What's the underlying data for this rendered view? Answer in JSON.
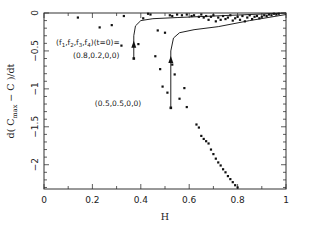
{
  "chart_data": {
    "type": "scatter",
    "title": "",
    "xlabel": "H",
    "ylabel": "d( C_max − C )/dt",
    "ylabel_parts": {
      "prefix": "d( C",
      "subscript": "max",
      "suffix": " − C )/dt"
    },
    "xlim": [
      0,
      1
    ],
    "ylim": [
      -2.32,
      0
    ],
    "grid": false,
    "legend": null,
    "x_ticks": [
      {
        "value": 0,
        "label": "0"
      },
      {
        "value": 0.2,
        "label": "0.2"
      },
      {
        "value": 0.4,
        "label": "0.4"
      },
      {
        "value": 0.6,
        "label": "0.6"
      },
      {
        "value": 0.8,
        "label": "0.8"
      },
      {
        "value": 1,
        "label": "1"
      }
    ],
    "y_ticks": [
      {
        "value": 0,
        "label": "0"
      },
      {
        "value": -0.5,
        "label": "−0.5"
      },
      {
        "value": -1,
        "label": "−1"
      },
      {
        "value": -1.5,
        "label": "−1.5"
      },
      {
        "value": -2,
        "label": "−2"
      }
    ],
    "annotations": [
      {
        "text": "(f1,f2,f3,f4)(t=0)=",
        "text_parts": [
          "(f",
          "1",
          ",f",
          "2",
          ",f",
          "3",
          ",f",
          "4",
          ")(t=0)="
        ],
        "x": 0.05,
        "y": -0.42
      },
      {
        "text": "(0.8,0.2,0,0)",
        "x": 0.12,
        "y": -0.59
      },
      {
        "text": "(0.5,0.5,0,0)",
        "x": 0.21,
        "y": -1.22
      }
    ],
    "series": [
      {
        "name": "scatter points",
        "kind": "points",
        "points": [
          [
            0.14,
            -0.06
          ],
          [
            0.23,
            -0.19
          ],
          [
            0.28,
            -0.16
          ],
          [
            0.33,
            -0.04
          ],
          [
            0.32,
            -0.43
          ],
          [
            0.39,
            -0.41
          ],
          [
            0.41,
            -0.07
          ],
          [
            0.43,
            -0.01
          ],
          [
            0.44,
            -0.02
          ],
          [
            0.52,
            -0.03
          ],
          [
            0.53,
            -0.04
          ],
          [
            0.55,
            -0.02
          ],
          [
            0.57,
            -0.03
          ],
          [
            0.59,
            -0.02
          ],
          [
            0.61,
            -0.04
          ],
          [
            0.62,
            -0.03
          ],
          [
            0.64,
            -0.05
          ],
          [
            0.65,
            -0.02
          ],
          [
            0.66,
            -0.06
          ],
          [
            0.67,
            -0.04
          ],
          [
            0.68,
            -0.09
          ],
          [
            0.69,
            -0.05
          ],
          [
            0.7,
            -0.03
          ],
          [
            0.71,
            -0.11
          ],
          [
            0.72,
            -0.06
          ],
          [
            0.73,
            -0.09
          ],
          [
            0.74,
            -0.04
          ],
          [
            0.75,
            -0.08
          ],
          [
            0.76,
            -0.06
          ],
          [
            0.77,
            -0.03
          ],
          [
            0.78,
            -0.1
          ],
          [
            0.79,
            -0.07
          ],
          [
            0.8,
            -0.05
          ],
          [
            0.81,
            -0.09
          ],
          [
            0.82,
            -0.04
          ],
          [
            0.83,
            -0.11
          ],
          [
            0.84,
            -0.06
          ],
          [
            0.85,
            -0.03
          ],
          [
            0.86,
            -0.08
          ],
          [
            0.87,
            -0.05
          ],
          [
            0.88,
            -0.04
          ],
          [
            0.89,
            -0.07
          ],
          [
            0.9,
            -0.05
          ],
          [
            0.91,
            -0.03
          ],
          [
            0.92,
            -0.04
          ],
          [
            0.93,
            -0.02
          ],
          [
            0.94,
            -0.03
          ],
          [
            0.95,
            -0.01
          ],
          [
            0.96,
            -0.02
          ],
          [
            0.97,
            -0.01
          ],
          [
            0.46,
            -0.57
          ],
          [
            0.47,
            -0.23
          ],
          [
            0.48,
            -0.74
          ],
          [
            0.49,
            -0.97
          ],
          [
            0.5,
            -0.26
          ],
          [
            0.51,
            -1.05
          ],
          [
            0.53,
            -0.68
          ],
          [
            0.54,
            -0.81
          ],
          [
            0.56,
            -1.13
          ],
          [
            0.58,
            -0.99
          ],
          [
            0.59,
            -1.24
          ],
          [
            0.63,
            -1.47
          ],
          [
            0.64,
            -1.51
          ],
          [
            0.65,
            -1.62
          ],
          [
            0.66,
            -1.66
          ],
          [
            0.67,
            -1.69
          ],
          [
            0.68,
            -1.72
          ],
          [
            0.69,
            -1.8
          ],
          [
            0.7,
            -1.86
          ],
          [
            0.71,
            -1.92
          ],
          [
            0.72,
            -1.97
          ],
          [
            0.73,
            -2.01
          ],
          [
            0.74,
            -2.06
          ],
          [
            0.75,
            -2.1
          ],
          [
            0.76,
            -2.15
          ],
          [
            0.77,
            -2.19
          ],
          [
            0.78,
            -2.23
          ],
          [
            0.79,
            -2.27
          ],
          [
            0.8,
            -2.3
          ]
        ]
      },
      {
        "name": "trajectory (0.8,0.2,0,0)",
        "kind": "line",
        "points": [
          [
            0.371,
            -0.6
          ],
          [
            0.371,
            -0.3
          ],
          [
            0.378,
            -0.17
          ],
          [
            0.4,
            -0.1
          ],
          [
            0.45,
            -0.075
          ],
          [
            0.55,
            -0.06
          ],
          [
            0.7,
            -0.04
          ],
          [
            0.85,
            -0.02
          ],
          [
            1.0,
            0.0
          ]
        ]
      },
      {
        "name": "trajectory (0.5,0.5,0,0)",
        "kind": "line",
        "points": [
          [
            0.524,
            -1.25
          ],
          [
            0.524,
            -0.5
          ],
          [
            0.535,
            -0.33
          ],
          [
            0.56,
            -0.26
          ],
          [
            0.62,
            -0.22
          ],
          [
            0.72,
            -0.18
          ],
          [
            0.85,
            -0.1
          ],
          [
            1.0,
            -0.02
          ]
        ]
      }
    ]
  }
}
